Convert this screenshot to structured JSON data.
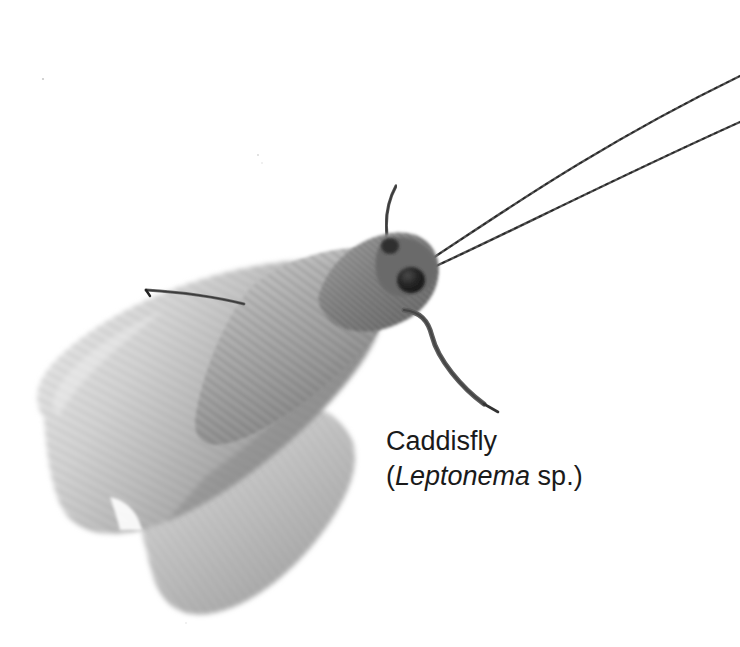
{
  "figure": {
    "background_color": "#ffffff",
    "width": 740,
    "height": 647,
    "rendering": "grayscale-photograph"
  },
  "caption": {
    "common_name": "Caddisfly",
    "scientific_open_paren": "(",
    "genus": "Leptonema",
    "species_qualifier": " sp.",
    "scientific_close_paren": ")",
    "scientific_full": "(Leptonema sp.)",
    "text_color": "#1a1a1a",
    "font_size_px": 27
  },
  "specimen": {
    "name": "caddisfly",
    "genus": "Leptonema",
    "orientation": "head-upper-right-wings-lower-left",
    "colors": {
      "background": "#ffffff",
      "wing_light": "#d8d8d8",
      "wing_mid": "#a8a8a8",
      "wing_dark": "#7a7a7a",
      "thorax_dark": "#555555",
      "eye_black": "#1c1c1c",
      "antenna_gray": "#4a4a4a",
      "leg_gray": "#5a5a5a"
    },
    "parts": [
      {
        "name": "forewing",
        "label": "forewing"
      },
      {
        "name": "hindwing",
        "label": "hindwing"
      },
      {
        "name": "thorax",
        "label": "thorax"
      },
      {
        "name": "head",
        "label": "head"
      },
      {
        "name": "compound-eye",
        "label": "compound eye"
      },
      {
        "name": "antenna-upper",
        "label": "upper antenna"
      },
      {
        "name": "antenna-lower",
        "label": "lower antenna"
      },
      {
        "name": "maxillary-palp",
        "label": "maxillary palp"
      },
      {
        "name": "foreleg",
        "label": "foreleg"
      },
      {
        "name": "midleg-spur",
        "label": "midleg spur"
      }
    ]
  }
}
